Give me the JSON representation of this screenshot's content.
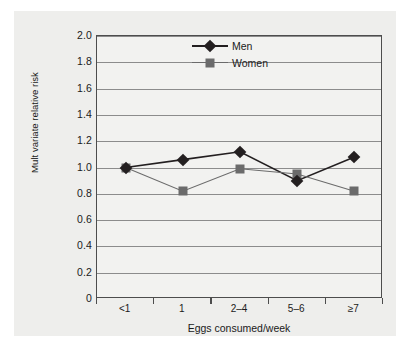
{
  "chart_data": {
    "type": "line",
    "title": "",
    "xlabel": "Eggs consumed/week",
    "ylabel": "Mult variate relative risk",
    "categories": [
      "<1",
      "1",
      "2–4",
      "5–6",
      "≥7"
    ],
    "series": [
      {
        "name": "Men",
        "marker": "diamond",
        "color": "#231f20",
        "values": [
          1.0,
          1.06,
          1.12,
          0.9,
          1.08
        ]
      },
      {
        "name": "Women",
        "marker": "square",
        "color": "#6b6b6b",
        "values": [
          1.0,
          0.82,
          0.99,
          0.95,
          0.82
        ]
      }
    ],
    "ylim": [
      0,
      2.0
    ],
    "yticks": [
      0,
      0.2,
      0.4,
      0.6,
      0.8,
      1.0,
      1.2,
      1.4,
      1.6,
      1.8,
      2.0
    ],
    "ytick_labels": [
      "0",
      "0.2",
      "0.4",
      "0.6",
      "0.8",
      "1.0",
      "1.2",
      "1.4",
      "1.6",
      "1.8",
      "2.0"
    ],
    "grid": true,
    "grid_axis": "y",
    "legend_position": "top-center"
  },
  "legend": {
    "entries": [
      {
        "label": "Men"
      },
      {
        "label": "Women"
      }
    ]
  },
  "colors": {
    "figure_background": "#eeeeec",
    "plot_background": "#f2f2f0",
    "axis": "#4d4d4d",
    "gridline": "#8c8c8c",
    "men": "#231f20",
    "women": "#6b6b6b",
    "text": "#1a1a1a"
  }
}
